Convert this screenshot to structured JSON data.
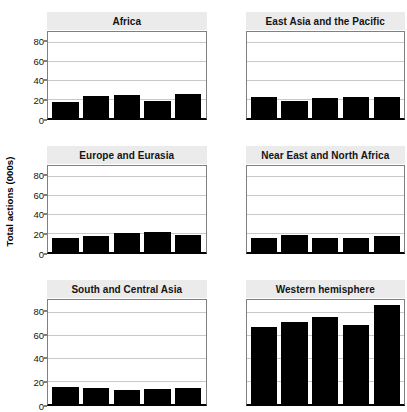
{
  "chart_data": {
    "type": "bar",
    "title": "",
    "xlabel": "",
    "ylabel": "Total actions (000s)",
    "ylim": [
      0,
      90
    ],
    "yticks": [
      0,
      20,
      40,
      60,
      80
    ],
    "grid": true,
    "legend": "none",
    "layout": "small-multiples 2 columns x 3 rows, shared y axis",
    "bars_per_panel": 5,
    "panels": [
      {
        "title": "Africa",
        "categories": [
          "1",
          "2",
          "3",
          "4",
          "5"
        ],
        "values": [
          17,
          23,
          24,
          18,
          25
        ]
      },
      {
        "title": "East Asia and the Pacific",
        "categories": [
          "1",
          "2",
          "3",
          "4",
          "5"
        ],
        "values": [
          22,
          18,
          21,
          22,
          22
        ]
      },
      {
        "title": "Europe and Eurasia",
        "categories": [
          "1",
          "2",
          "3",
          "4",
          "5"
        ],
        "values": [
          15,
          17,
          20,
          21,
          18
        ]
      },
      {
        "title": "Near East and North Africa",
        "categories": [
          "1",
          "2",
          "3",
          "4",
          "5"
        ],
        "values": [
          15,
          18,
          15,
          15,
          17
        ]
      },
      {
        "title": "South and Central Asia",
        "categories": [
          "1",
          "2",
          "3",
          "4",
          "5"
        ],
        "values": [
          15,
          14,
          12,
          13,
          14
        ]
      },
      {
        "title": "Western hemisphere",
        "categories": [
          "1",
          "2",
          "3",
          "4",
          "5"
        ],
        "values": [
          67,
          71,
          75,
          68,
          86
        ]
      }
    ],
    "colors": {
      "bar": "#000000",
      "gridline": "#c9c9c9",
      "panel_strip": "#ebebeb",
      "axis": "#000000",
      "plot_border": "#808080",
      "background": "#ffffff",
      "text": "#141414"
    }
  }
}
